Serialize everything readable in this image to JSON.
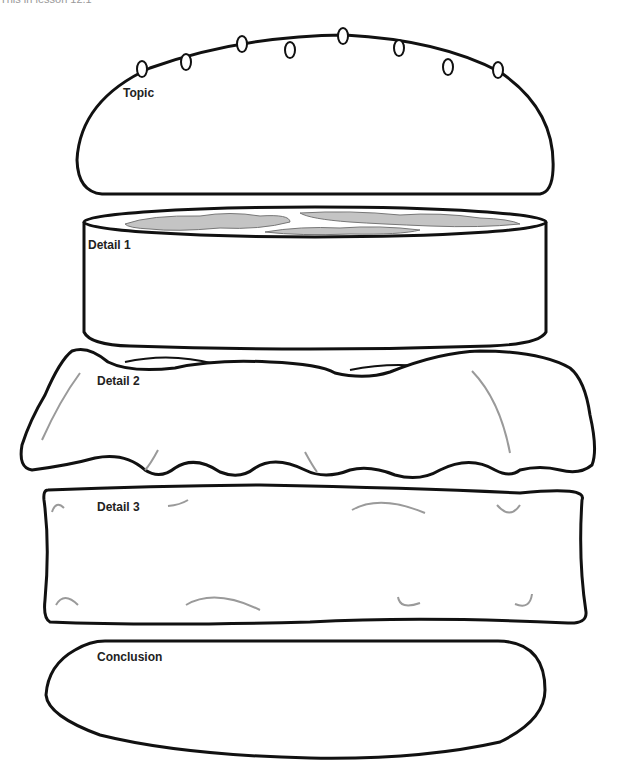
{
  "header": {
    "text": "This in lesson 12.1"
  },
  "burger": {
    "sections": [
      {
        "id": "topic",
        "label": "Topic",
        "shape": "top-bun"
      },
      {
        "id": "detail1",
        "label": "Detail 1",
        "shape": "patty"
      },
      {
        "id": "detail2",
        "label": "Detail 2",
        "shape": "lettuce"
      },
      {
        "id": "detail3",
        "label": "Detail 3",
        "shape": "cheese"
      },
      {
        "id": "conclusion",
        "label": "Conclusion",
        "shape": "bottom-bun"
      }
    ]
  },
  "colors": {
    "outline": "#111111",
    "accent_lines": "#9a9a9a",
    "patty_top": "#bdbdbd"
  }
}
